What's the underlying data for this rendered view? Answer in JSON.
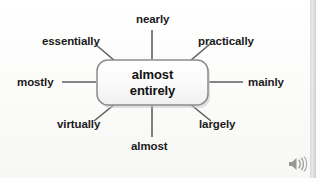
{
  "diagram": {
    "type": "mind-map-spoke",
    "center": {
      "line1": "almost",
      "line2": "entirely",
      "shape": "rounded-rectangle"
    },
    "spokes": [
      {
        "id": "nearly",
        "label": "nearly",
        "position": "top"
      },
      {
        "id": "practically",
        "label": "practically",
        "position": "top-right"
      },
      {
        "id": "mainly",
        "label": "mainly",
        "position": "right"
      },
      {
        "id": "largely",
        "label": "largely",
        "position": "bottom-right"
      },
      {
        "id": "almost",
        "label": "almost",
        "position": "bottom"
      },
      {
        "id": "virtually",
        "label": "virtually",
        "position": "bottom-left"
      },
      {
        "id": "mostly",
        "label": "mostly",
        "position": "left"
      },
      {
        "id": "essentially",
        "label": "essentially",
        "position": "top-left"
      }
    ]
  },
  "controls": {
    "speaker": "speaker-icon"
  },
  "colors": {
    "background": "#fbfbfa",
    "text": "#111111",
    "line": "#5f5f5f",
    "box_border": "#8c8c8c"
  }
}
